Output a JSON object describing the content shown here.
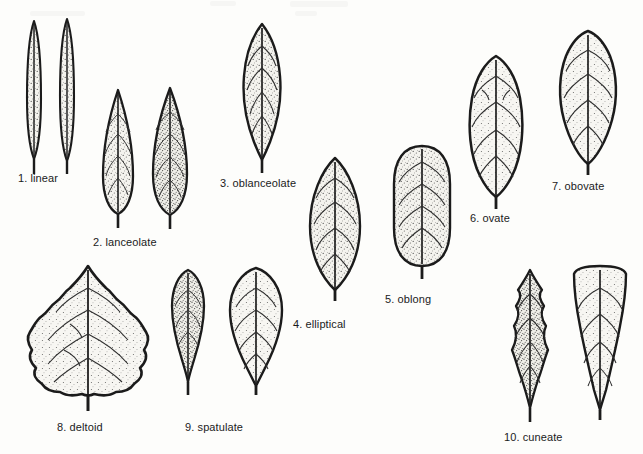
{
  "plate": {
    "title": "Leaf shape types",
    "background_color": "#fdfdfb",
    "ink_color": "#1b1b1b",
    "fill_color": "#f2f1ec",
    "stipple_color": "#4a4a4a",
    "width": 643,
    "height": 454
  },
  "figures": [
    {
      "number": "1",
      "name": "linear",
      "caption": "1. linear",
      "shape": "linear",
      "description": "Very narrow, parallel-sided blade with both ends tapering; length many times the width.",
      "specimens": 2,
      "caption_x": 18,
      "caption_y": 172
    },
    {
      "number": "2",
      "name": "lanceolate",
      "caption": "2. lanceolate",
      "shape": "lanceolate",
      "description": "Lance-shaped; widest below the middle and tapering to a pointed apex.",
      "specimens": 2,
      "caption_x": 93,
      "caption_y": 236
    },
    {
      "number": "3",
      "name": "oblanceolate",
      "caption": "3. oblanceolate",
      "shape": "oblanceolate",
      "description": "Inversely lance-shaped; widest above the middle and tapering toward the base.",
      "specimens": 1,
      "caption_x": 220,
      "caption_y": 177
    },
    {
      "number": "4",
      "name": "elliptical",
      "caption": "4. elliptical",
      "shape": "elliptical",
      "description": "Widest at the middle with both ends tapering equally.",
      "specimens": 1,
      "caption_x": 293,
      "caption_y": 318
    },
    {
      "number": "5",
      "name": "oblong",
      "caption": "5. oblong",
      "shape": "oblong",
      "description": "Roughly parallel-sided with rounded ends; about twice as long as wide.",
      "specimens": 1,
      "caption_x": 385,
      "caption_y": 293
    },
    {
      "number": "6",
      "name": "ovate",
      "caption": "6. ovate",
      "shape": "ovate",
      "description": "Egg-shaped, broadest near the base and narrowing toward the apex.",
      "specimens": 1,
      "caption_x": 470,
      "caption_y": 212
    },
    {
      "number": "7",
      "name": "obovate",
      "caption": "7. obovate",
      "shape": "obovate",
      "description": "Inversely egg-shaped, broadest above the middle and narrowing to the base.",
      "specimens": 1,
      "caption_x": 552,
      "caption_y": 180
    },
    {
      "number": "8",
      "name": "deltoid",
      "caption": "8. deltoid",
      "shape": "deltoid",
      "description": "Triangular blade with a broad, nearly straight base and crenate margin.",
      "specimens": 1,
      "caption_x": 57,
      "caption_y": 421
    },
    {
      "number": "9",
      "name": "spatulate",
      "caption": "9. spatulate",
      "shape": "spatulate",
      "description": "Spoon-shaped; rounded at the apex and gradually narrowed to the base.",
      "specimens": 2,
      "caption_x": 185,
      "caption_y": 421
    },
    {
      "number": "10",
      "name": "cuneate",
      "caption": "10. cuneate",
      "shape": "cuneate",
      "description": "Wedge-shaped; narrow at the base and widening toward a broad apex.",
      "specimens": 2,
      "caption_x": 504,
      "caption_y": 431
    }
  ]
}
